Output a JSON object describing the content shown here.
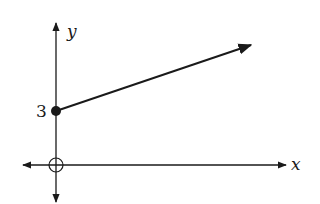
{
  "diagram": {
    "type": "coordinate-graph",
    "axes": {
      "x_label": "x",
      "y_label": "y"
    },
    "y_intercept_label": "3",
    "ray": {
      "start_point": {
        "x": 0,
        "y": 3,
        "style": "closed-dot"
      },
      "direction": "up-right"
    },
    "origin_marker": "open-circle",
    "colors": {
      "stroke": "#1a1a1a",
      "background": "#ffffff"
    }
  }
}
